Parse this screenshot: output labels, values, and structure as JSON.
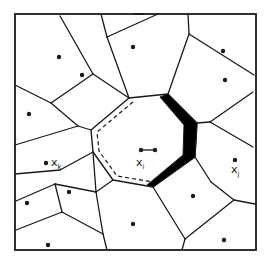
{
  "diagram": {
    "type": "voronoi-tessellation",
    "colors": {
      "line": "#1a1a1a",
      "fill_highlight": "#000000",
      "background": "#ffffff"
    },
    "labels": {
      "xi": {
        "base": "x",
        "sub": "i"
      },
      "xj": {
        "base": "x",
        "sub": "j"
      },
      "xk": {
        "base": "x",
        "sub": "k"
      }
    },
    "frame": {
      "x1": 15,
      "y1": 14,
      "x2": 256,
      "y2": 250
    },
    "edges": [
      [
        15,
        85,
        51,
        103
      ],
      [
        51,
        103,
        93,
        74
      ],
      [
        93,
        74,
        60,
        16
      ],
      [
        93,
        74,
        129,
        98
      ],
      [
        101,
        14,
        107,
        37
      ],
      [
        107,
        37,
        129,
        98
      ],
      [
        107,
        37,
        158,
        14
      ],
      [
        134,
        14,
        143,
        14
      ],
      [
        188,
        14,
        189,
        34
      ],
      [
        189,
        34,
        168,
        94
      ],
      [
        189,
        34,
        254,
        75
      ],
      [
        254,
        75,
        254,
        75
      ],
      [
        15,
        145,
        78,
        126
      ],
      [
        78,
        126,
        91,
        130
      ],
      [
        51,
        103,
        78,
        126
      ],
      [
        197,
        123,
        210,
        122
      ],
      [
        210,
        122,
        253,
        92
      ],
      [
        210,
        122,
        253,
        147
      ],
      [
        195,
        157,
        211,
        182
      ],
      [
        211,
        182,
        234,
        200
      ],
      [
        234,
        200,
        255,
        204
      ],
      [
        234,
        200,
        185,
        239
      ],
      [
        185,
        239,
        182,
        250
      ],
      [
        153,
        187,
        185,
        239
      ],
      [
        153,
        187,
        153,
        187
      ],
      [
        113,
        180,
        96,
        192
      ],
      [
        96,
        192,
        55,
        184
      ],
      [
        55,
        184,
        16,
        201
      ],
      [
        55,
        184,
        62,
        212
      ],
      [
        93,
        152,
        60,
        170
      ],
      [
        60,
        170,
        15,
        174
      ],
      [
        96,
        192,
        103,
        234
      ],
      [
        103,
        234,
        62,
        212
      ],
      [
        103,
        234,
        107,
        250
      ],
      [
        62,
        212,
        16,
        230
      ],
      [
        93,
        152,
        96,
        192
      ]
    ],
    "central_cell": [
      [
        129,
        98
      ],
      [
        168,
        94
      ],
      [
        197,
        123
      ],
      [
        195,
        157
      ],
      [
        153,
        187
      ],
      [
        113,
        180
      ],
      [
        93,
        152
      ],
      [
        91,
        130
      ]
    ],
    "thick_region": [
      [
        168,
        94
      ],
      [
        197,
        123
      ],
      [
        195,
        157
      ],
      [
        153,
        187
      ],
      [
        147,
        185
      ],
      [
        183,
        155
      ],
      [
        184,
        125
      ],
      [
        160,
        97
      ]
    ],
    "dashed_path": [
      [
        133,
        102
      ],
      [
        97,
        132
      ],
      [
        99,
        151
      ],
      [
        117,
        176
      ],
      [
        153,
        182
      ]
    ],
    "sites": [
      {
        "id": "s1",
        "x": 59,
        "y": 57
      },
      {
        "id": "s2",
        "x": 82,
        "y": 75
      },
      {
        "id": "s3",
        "x": 133,
        "y": 47
      },
      {
        "id": "s4",
        "x": 223,
        "y": 51
      },
      {
        "id": "s5",
        "x": 225,
        "y": 80
      },
      {
        "id": "s6",
        "x": 29,
        "y": 114
      },
      {
        "id": "xk",
        "x": 46,
        "y": 163,
        "label": "xk"
      },
      {
        "id": "s7",
        "x": 69,
        "y": 192
      },
      {
        "id": "s8",
        "x": 27,
        "y": 203
      },
      {
        "id": "s9",
        "x": 48,
        "y": 245
      },
      {
        "id": "s10",
        "x": 133,
        "y": 224
      },
      {
        "id": "s11",
        "x": 193,
        "y": 196
      },
      {
        "id": "s12",
        "x": 224,
        "y": 240
      },
      {
        "id": "xj",
        "x": 235,
        "y": 160,
        "label": "xj"
      }
    ],
    "xi_marker": {
      "x1": 141,
      "y1": 150,
      "x2": 155,
      "y2": 150
    }
  }
}
